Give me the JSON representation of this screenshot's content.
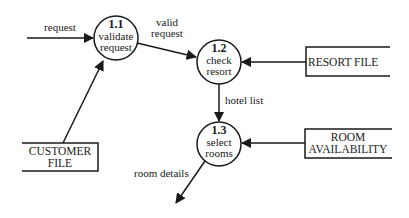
{
  "diagram": {
    "type": "data-flow-diagram",
    "processes": [
      {
        "id": "1.1",
        "line1": "validate",
        "line2": "request",
        "cx": 116,
        "cy": 38,
        "r": 22
      },
      {
        "id": "1.2",
        "line1": "check",
        "line2": "resort",
        "cx": 219,
        "cy": 62,
        "r": 22
      },
      {
        "id": "1.3",
        "line1": "select",
        "line2": "rooms",
        "cx": 219,
        "cy": 144,
        "r": 22
      }
    ],
    "stores": [
      {
        "name": "resort-file",
        "line1": "RESORT FILE",
        "line2": ""
      },
      {
        "name": "room-availability",
        "line1": "ROOM",
        "line2": "AVAILABILITY"
      },
      {
        "name": "customer-file",
        "line1": "CUSTOMER",
        "line2": "FILE"
      }
    ],
    "flows": [
      {
        "label": "request",
        "from": "external",
        "to": "1.1"
      },
      {
        "label_line1": "valid",
        "label_line2": "request",
        "from": "1.1",
        "to": "1.2"
      },
      {
        "label": "",
        "from": "RESORT FILE",
        "to": "1.2"
      },
      {
        "label": "hotel list",
        "from": "1.2",
        "to": "1.3"
      },
      {
        "label": "",
        "from": "ROOM AVAILABILITY",
        "to": "1.3"
      },
      {
        "label": "",
        "from": "CUSTOMER FILE",
        "to": "1.1"
      },
      {
        "label": "room details",
        "from": "1.3",
        "to": "external"
      }
    ],
    "colors": {
      "line": "#1a1a1a",
      "background": "#ffffff"
    }
  }
}
